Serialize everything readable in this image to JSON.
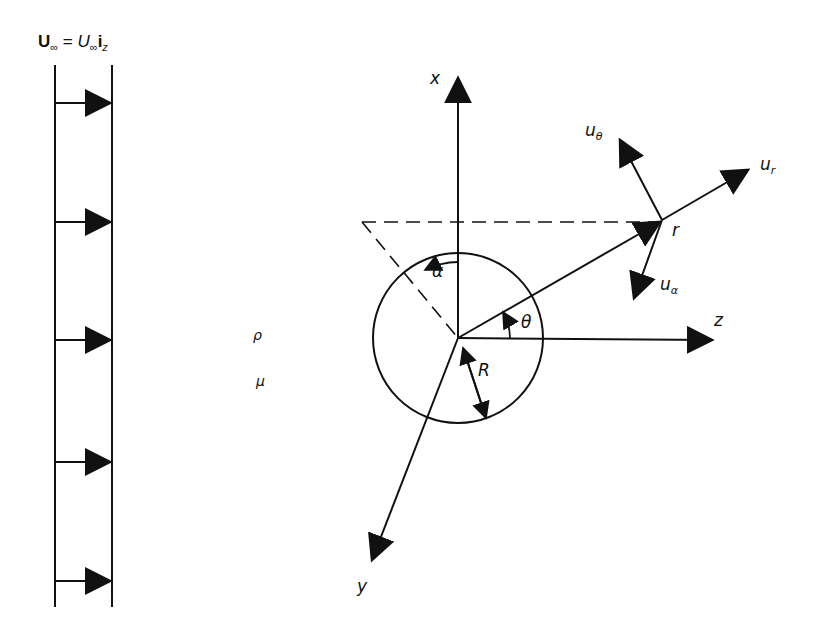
{
  "figure": {
    "title": {
      "lhs": "U",
      "lhs_sub": "∞",
      "eq": " = ",
      "rhs": "U",
      "rhs_sub": "∞",
      "unit": "i",
      "unit_sub": "z"
    },
    "free_stream": {
      "arrow_count": 5,
      "arrow_y": [
        103,
        222,
        340,
        462,
        581
      ]
    },
    "fluid_properties": {
      "density": "ρ",
      "viscosity": "μ"
    },
    "axes": {
      "x": "x",
      "y": "y",
      "z": "z"
    },
    "sphere": {
      "radius_label": "R"
    },
    "angles": {
      "alpha": "α",
      "theta": "θ"
    },
    "point": {
      "label": "r"
    },
    "velocity_components": {
      "ur": "u",
      "ur_sub": "r",
      "utheta": "u",
      "utheta_sub": "θ",
      "ualpha": "u",
      "ualpha_sub": "α"
    },
    "colors": {
      "ink": "#111111",
      "background": "#ffffff"
    }
  }
}
